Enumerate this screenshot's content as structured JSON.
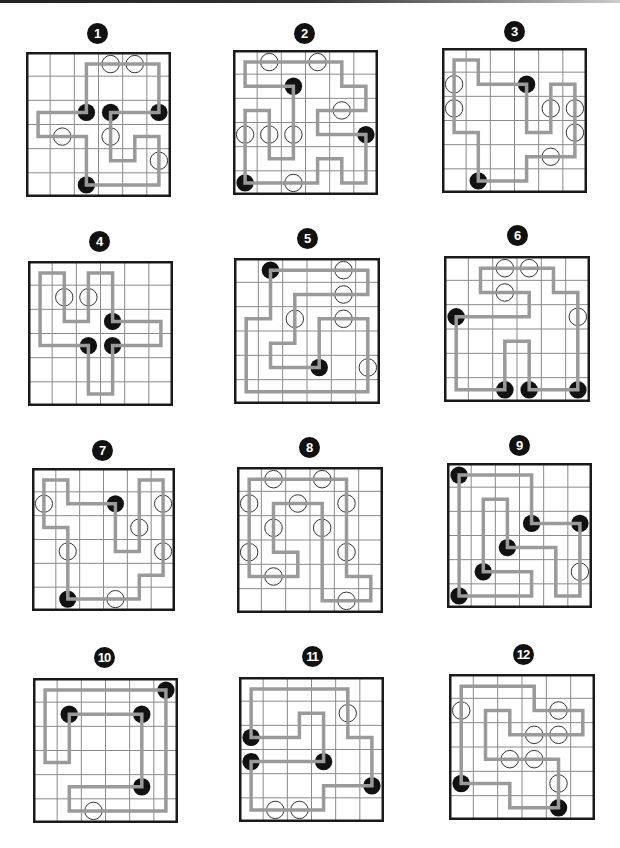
{
  "page": {
    "grid_size": 6
  },
  "colors": {
    "loop": "#9a9a9a",
    "grid_line": "#8a8a8a",
    "border": "#1a1a1a",
    "black_pearl": "#111111",
    "white_pearl_fill": "#ffffff",
    "white_pearl_stroke": "#333333",
    "badge_bg": "#111111",
    "badge_text": "#ffffff"
  },
  "puzzles": [
    {
      "number": "1",
      "badge": {
        "x": 97,
        "y": 33
      },
      "grid": {
        "x": 26,
        "y": 52,
        "size": 145
      },
      "pearls": [
        {
          "col": 3,
          "row": 0,
          "type": "white"
        },
        {
          "col": 4,
          "row": 0,
          "type": "white"
        },
        {
          "col": 2,
          "row": 2,
          "type": "black"
        },
        {
          "col": 3,
          "row": 2,
          "type": "black"
        },
        {
          "col": 5,
          "row": 2,
          "type": "black"
        },
        {
          "col": 1,
          "row": 3,
          "type": "white"
        },
        {
          "col": 3,
          "row": 3,
          "type": "white"
        },
        {
          "col": 5,
          "row": 4,
          "type": "white"
        },
        {
          "col": 2,
          "row": 5,
          "type": "black"
        }
      ],
      "loop": [
        [
          2,
          2
        ],
        [
          2,
          0
        ],
        [
          5,
          0
        ],
        [
          5,
          2
        ],
        [
          3,
          2
        ],
        [
          3,
          4
        ],
        [
          4,
          4
        ],
        [
          4,
          3
        ],
        [
          5,
          3
        ],
        [
          5,
          5
        ],
        [
          2,
          5
        ],
        [
          2,
          3
        ],
        [
          0,
          3
        ],
        [
          0,
          2
        ],
        [
          2,
          2
        ]
      ]
    },
    {
      "number": "2",
      "badge": {
        "x": 304,
        "y": 33
      },
      "grid": {
        "x": 233,
        "y": 50,
        "size": 145
      },
      "pearls": [
        {
          "col": 1,
          "row": 0,
          "type": "white"
        },
        {
          "col": 3,
          "row": 0,
          "type": "white"
        },
        {
          "col": 2,
          "row": 1,
          "type": "black"
        },
        {
          "col": 4,
          "row": 2,
          "type": "white"
        },
        {
          "col": 0,
          "row": 3,
          "type": "white"
        },
        {
          "col": 1,
          "row": 3,
          "type": "white"
        },
        {
          "col": 2,
          "row": 3,
          "type": "white"
        },
        {
          "col": 5,
          "row": 3,
          "type": "black"
        },
        {
          "col": 0,
          "row": 5,
          "type": "black"
        },
        {
          "col": 2,
          "row": 5,
          "type": "white"
        }
      ],
      "loop": [
        [
          0,
          5
        ],
        [
          0,
          2
        ],
        [
          1,
          2
        ],
        [
          1,
          4
        ],
        [
          2,
          4
        ],
        [
          2,
          1
        ],
        [
          0,
          1
        ],
        [
          0,
          0
        ],
        [
          4,
          0
        ],
        [
          4,
          1
        ],
        [
          5,
          1
        ],
        [
          5,
          2
        ],
        [
          3,
          2
        ],
        [
          3,
          3
        ],
        [
          5,
          3
        ],
        [
          5,
          5
        ],
        [
          4,
          5
        ],
        [
          4,
          4
        ],
        [
          3,
          4
        ],
        [
          3,
          5
        ],
        [
          0,
          5
        ]
      ]
    },
    {
      "number": "3",
      "badge": {
        "x": 514,
        "y": 31
      },
      "grid": {
        "x": 442,
        "y": 48,
        "size": 145
      },
      "pearls": [
        {
          "col": 0,
          "row": 1,
          "type": "white"
        },
        {
          "col": 0,
          "row": 2,
          "type": "white"
        },
        {
          "col": 3,
          "row": 1,
          "type": "black"
        },
        {
          "col": 4,
          "row": 2,
          "type": "white"
        },
        {
          "col": 5,
          "row": 2,
          "type": "white"
        },
        {
          "col": 5,
          "row": 3,
          "type": "white"
        },
        {
          "col": 4,
          "row": 4,
          "type": "white"
        },
        {
          "col": 1,
          "row": 5,
          "type": "black"
        }
      ],
      "loop": [
        [
          1,
          5
        ],
        [
          1,
          3
        ],
        [
          0,
          3
        ],
        [
          0,
          0
        ],
        [
          1,
          0
        ],
        [
          1,
          1
        ],
        [
          3,
          1
        ],
        [
          3,
          3
        ],
        [
          4,
          3
        ],
        [
          4,
          1
        ],
        [
          5,
          1
        ],
        [
          5,
          4
        ],
        [
          3,
          4
        ],
        [
          3,
          5
        ],
        [
          1,
          5
        ]
      ]
    },
    {
      "number": "4",
      "badge": {
        "x": 99,
        "y": 241
      },
      "grid": {
        "x": 28,
        "y": 261,
        "size": 145
      },
      "pearls": [
        {
          "col": 1,
          "row": 1,
          "type": "white"
        },
        {
          "col": 2,
          "row": 1,
          "type": "white"
        },
        {
          "col": 3,
          "row": 2,
          "type": "black"
        },
        {
          "col": 2,
          "row": 3,
          "type": "black"
        },
        {
          "col": 3,
          "row": 3,
          "type": "black"
        }
      ],
      "loop": [
        [
          2,
          3
        ],
        [
          0,
          3
        ],
        [
          0,
          0
        ],
        [
          1,
          0
        ],
        [
          1,
          2
        ],
        [
          2,
          2
        ],
        [
          2,
          0
        ],
        [
          3,
          0
        ],
        [
          3,
          2
        ],
        [
          5,
          2
        ],
        [
          5,
          3
        ],
        [
          3,
          3
        ],
        [
          3,
          5
        ],
        [
          2,
          5
        ],
        [
          2,
          3
        ]
      ]
    },
    {
      "number": "5",
      "badge": {
        "x": 307,
        "y": 238
      },
      "grid": {
        "x": 234,
        "y": 258,
        "size": 146
      },
      "pearls": [
        {
          "col": 1,
          "row": 0,
          "type": "black"
        },
        {
          "col": 4,
          "row": 0,
          "type": "white"
        },
        {
          "col": 4,
          "row": 1,
          "type": "white"
        },
        {
          "col": 2,
          "row": 2,
          "type": "white"
        },
        {
          "col": 4,
          "row": 2,
          "type": "white"
        },
        {
          "col": 3,
          "row": 4,
          "type": "black"
        },
        {
          "col": 5,
          "row": 4,
          "type": "white"
        }
      ],
      "loop": [
        [
          1,
          0
        ],
        [
          5,
          0
        ],
        [
          5,
          1
        ],
        [
          2,
          1
        ],
        [
          2,
          3
        ],
        [
          1,
          3
        ],
        [
          1,
          4
        ],
        [
          3,
          4
        ],
        [
          3,
          2
        ],
        [
          5,
          2
        ],
        [
          5,
          5
        ],
        [
          0,
          5
        ],
        [
          0,
          2
        ],
        [
          1,
          2
        ],
        [
          1,
          0
        ]
      ]
    },
    {
      "number": "6",
      "badge": {
        "x": 517,
        "y": 235
      },
      "grid": {
        "x": 444,
        "y": 256,
        "size": 146
      },
      "pearls": [
        {
          "col": 2,
          "row": 0,
          "type": "white"
        },
        {
          "col": 3,
          "row": 0,
          "type": "white"
        },
        {
          "col": 2,
          "row": 1,
          "type": "white"
        },
        {
          "col": 0,
          "row": 2,
          "type": "black"
        },
        {
          "col": 5,
          "row": 2,
          "type": "white"
        },
        {
          "col": 2,
          "row": 5,
          "type": "black"
        },
        {
          "col": 3,
          "row": 5,
          "type": "black"
        },
        {
          "col": 5,
          "row": 5,
          "type": "black"
        }
      ],
      "loop": [
        [
          0,
          2
        ],
        [
          3,
          2
        ],
        [
          3,
          1
        ],
        [
          1,
          1
        ],
        [
          1,
          0
        ],
        [
          4,
          0
        ],
        [
          4,
          1
        ],
        [
          5,
          1
        ],
        [
          5,
          5
        ],
        [
          3,
          5
        ],
        [
          3,
          3
        ],
        [
          2,
          3
        ],
        [
          2,
          5
        ],
        [
          0,
          5
        ],
        [
          0,
          2
        ]
      ]
    },
    {
      "number": "7",
      "badge": {
        "x": 102,
        "y": 450
      },
      "grid": {
        "x": 32,
        "y": 468,
        "size": 143
      },
      "pearls": [
        {
          "col": 0,
          "row": 1,
          "type": "white"
        },
        {
          "col": 3,
          "row": 1,
          "type": "black"
        },
        {
          "col": 5,
          "row": 1,
          "type": "white"
        },
        {
          "col": 4,
          "row": 2,
          "type": "white"
        },
        {
          "col": 1,
          "row": 3,
          "type": "white"
        },
        {
          "col": 5,
          "row": 3,
          "type": "white"
        },
        {
          "col": 1,
          "row": 5,
          "type": "black"
        },
        {
          "col": 3,
          "row": 5,
          "type": "white"
        }
      ],
      "loop": [
        [
          1,
          5
        ],
        [
          1,
          2
        ],
        [
          0,
          2
        ],
        [
          0,
          0
        ],
        [
          1,
          0
        ],
        [
          1,
          1
        ],
        [
          3,
          1
        ],
        [
          3,
          3
        ],
        [
          4,
          3
        ],
        [
          4,
          0
        ],
        [
          5,
          0
        ],
        [
          5,
          4
        ],
        [
          4,
          4
        ],
        [
          4,
          5
        ],
        [
          1,
          5
        ]
      ]
    },
    {
      "number": "8",
      "badge": {
        "x": 309,
        "y": 447
      },
      "grid": {
        "x": 237,
        "y": 467,
        "size": 146
      },
      "pearls": [
        {
          "col": 1,
          "row": 0,
          "type": "white"
        },
        {
          "col": 3,
          "row": 0,
          "type": "white"
        },
        {
          "col": 0,
          "row": 1,
          "type": "white"
        },
        {
          "col": 2,
          "row": 1,
          "type": "white"
        },
        {
          "col": 4,
          "row": 1,
          "type": "white"
        },
        {
          "col": 1,
          "row": 2,
          "type": "white"
        },
        {
          "col": 3,
          "row": 2,
          "type": "white"
        },
        {
          "col": 0,
          "row": 3,
          "type": "white"
        },
        {
          "col": 4,
          "row": 3,
          "type": "white"
        },
        {
          "col": 1,
          "row": 4,
          "type": "white"
        },
        {
          "col": 4,
          "row": 5,
          "type": "white"
        }
      ],
      "loop": [
        [
          0,
          0
        ],
        [
          4,
          0
        ],
        [
          4,
          4
        ],
        [
          5,
          4
        ],
        [
          5,
          5
        ],
        [
          3,
          5
        ],
        [
          3,
          1
        ],
        [
          1,
          1
        ],
        [
          1,
          3
        ],
        [
          2,
          3
        ],
        [
          2,
          4
        ],
        [
          0,
          4
        ],
        [
          0,
          0
        ]
      ]
    },
    {
      "number": "9",
      "badge": {
        "x": 519,
        "y": 445
      },
      "grid": {
        "x": 447,
        "y": 463,
        "size": 145
      },
      "pearls": [
        {
          "col": 0,
          "row": 0,
          "type": "black"
        },
        {
          "col": 3,
          "row": 2,
          "type": "black"
        },
        {
          "col": 5,
          "row": 2,
          "type": "black"
        },
        {
          "col": 2,
          "row": 3,
          "type": "black"
        },
        {
          "col": 1,
          "row": 4,
          "type": "black"
        },
        {
          "col": 5,
          "row": 4,
          "type": "white"
        },
        {
          "col": 0,
          "row": 5,
          "type": "black"
        }
      ],
      "loop": [
        [
          0,
          0
        ],
        [
          3,
          0
        ],
        [
          3,
          2
        ],
        [
          5,
          2
        ],
        [
          5,
          5
        ],
        [
          4,
          5
        ],
        [
          4,
          3
        ],
        [
          2,
          3
        ],
        [
          2,
          1
        ],
        [
          1,
          1
        ],
        [
          1,
          4
        ],
        [
          3,
          4
        ],
        [
          3,
          5
        ],
        [
          0,
          5
        ],
        [
          0,
          0
        ]
      ]
    },
    {
      "number": "10",
      "badge": {
        "x": 104,
        "y": 657
      },
      "grid": {
        "x": 33,
        "y": 678,
        "size": 145
      },
      "pearls": [
        {
          "col": 5,
          "row": 0,
          "type": "black"
        },
        {
          "col": 1,
          "row": 1,
          "type": "black"
        },
        {
          "col": 4,
          "row": 1,
          "type": "black"
        },
        {
          "col": 4,
          "row": 4,
          "type": "black"
        },
        {
          "col": 2,
          "row": 5,
          "type": "white"
        }
      ],
      "loop": [
        [
          5,
          0
        ],
        [
          0,
          0
        ],
        [
          0,
          3
        ],
        [
          1,
          3
        ],
        [
          1,
          1
        ],
        [
          4,
          1
        ],
        [
          4,
          4
        ],
        [
          1,
          4
        ],
        [
          1,
          5
        ],
        [
          5,
          5
        ],
        [
          5,
          0
        ]
      ]
    },
    {
      "number": "11",
      "badge": {
        "x": 312,
        "y": 656
      },
      "grid": {
        "x": 239,
        "y": 677,
        "size": 145
      },
      "pearls": [
        {
          "col": 4,
          "row": 1,
          "type": "white"
        },
        {
          "col": 0,
          "row": 2,
          "type": "black"
        },
        {
          "col": 0,
          "row": 3,
          "type": "black"
        },
        {
          "col": 3,
          "row": 3,
          "type": "black"
        },
        {
          "col": 5,
          "row": 4,
          "type": "black"
        },
        {
          "col": 1,
          "row": 5,
          "type": "white"
        },
        {
          "col": 2,
          "row": 5,
          "type": "white"
        }
      ],
      "loop": [
        [
          0,
          2
        ],
        [
          0,
          0
        ],
        [
          4,
          0
        ],
        [
          4,
          2
        ],
        [
          5,
          2
        ],
        [
          5,
          4
        ],
        [
          3,
          4
        ],
        [
          3,
          5
        ],
        [
          0,
          5
        ],
        [
          0,
          3
        ],
        [
          3,
          3
        ],
        [
          3,
          1
        ],
        [
          2,
          1
        ],
        [
          2,
          2
        ],
        [
          0,
          2
        ]
      ]
    },
    {
      "number": "12",
      "badge": {
        "x": 523,
        "y": 654
      },
      "grid": {
        "x": 449,
        "y": 674,
        "size": 146
      },
      "pearls": [
        {
          "col": 0,
          "row": 1,
          "type": "white"
        },
        {
          "col": 4,
          "row": 1,
          "type": "white"
        },
        {
          "col": 3,
          "row": 2,
          "type": "white"
        },
        {
          "col": 4,
          "row": 2,
          "type": "white"
        },
        {
          "col": 2,
          "row": 3,
          "type": "white"
        },
        {
          "col": 3,
          "row": 3,
          "type": "white"
        },
        {
          "col": 4,
          "row": 4,
          "type": "white"
        },
        {
          "col": 0,
          "row": 4,
          "type": "black"
        },
        {
          "col": 4,
          "row": 5,
          "type": "black"
        }
      ],
      "loop": [
        [
          0,
          4
        ],
        [
          0,
          0
        ],
        [
          3,
          0
        ],
        [
          3,
          1
        ],
        [
          5,
          1
        ],
        [
          5,
          2
        ],
        [
          2,
          2
        ],
        [
          2,
          1
        ],
        [
          1,
          1
        ],
        [
          1,
          3
        ],
        [
          4,
          3
        ],
        [
          4,
          5
        ],
        [
          2,
          5
        ],
        [
          2,
          4
        ],
        [
          0,
          4
        ]
      ]
    }
  ]
}
